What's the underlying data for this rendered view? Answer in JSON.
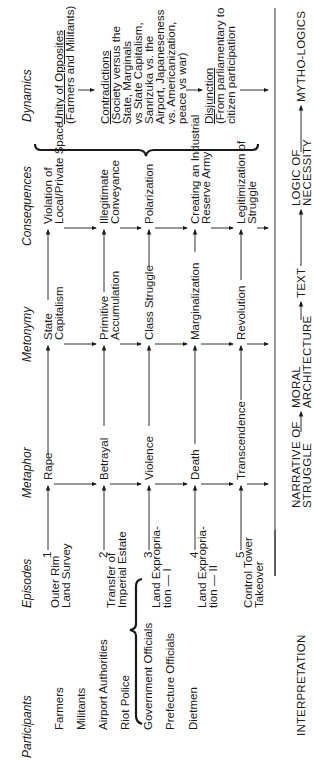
{
  "headers": {
    "participants": "Participants",
    "episodes": "Episodes",
    "metaphor": "Metaphor",
    "metonymy": "Metonymy",
    "consequences": "Consequences",
    "dynamics": "Dynamics"
  },
  "participants": [
    "Farmers",
    "Militants",
    "Airport Authorities",
    "Riot Police",
    "Government Officials",
    "Prefecture Officials",
    "Dietmen"
  ],
  "episodes": [
    {
      "num": "1",
      "l1": "Outer Rim",
      "l2": "Land Survey"
    },
    {
      "num": "2",
      "l1": "Transfer of",
      "l2": "Imperial Estate"
    },
    {
      "num": "3",
      "l1": "Land Expropria-",
      "l2": "tion — I"
    },
    {
      "num": "4",
      "l1": "Land Expropria-",
      "l2": "tion — II"
    },
    {
      "num": "5",
      "l1": "Control Tower",
      "l2": "Takeover"
    }
  ],
  "metaphor": [
    "Rape",
    "Betrayal",
    "Violence",
    "Death",
    "Transcendence"
  ],
  "metonymy": [
    {
      "l1": "State",
      "l2": "Capitalism"
    },
    {
      "l1": "Primitive",
      "l2": "Accumulation"
    },
    {
      "l1": "Class Struggle",
      "l2": ""
    },
    {
      "l1": "Marginalization",
      "l2": ""
    },
    {
      "l1": "Revolution",
      "l2": ""
    }
  ],
  "consequences": [
    {
      "l1": "Violation of",
      "l2": "Local/Private Space"
    },
    {
      "l1": "Illegitimate",
      "l2": "Conveyance"
    },
    {
      "l1": "Polarization",
      "l2": ""
    },
    {
      "l1": "Creating an Industrial",
      "l2": "Reserve Army"
    },
    {
      "l1": "Legitimization of",
      "l2": "Struggle"
    }
  ],
  "dynamics": {
    "unity_title": "Unity of Opposites",
    "unity_sub": "(Farmers and Militants)",
    "contradictions_title": "Contradictions",
    "contradictions_lines": [
      "(Society versus the",
      "State, Marginals",
      "vs State Capitalism,",
      "Sanrizuka vs. the",
      "Airport, Japaneseness",
      "vs. Americanization,",
      "peace vs war)"
    ],
    "disjunction_title": "Disjunction",
    "disjunction_lines": [
      "(From parliamentary to",
      "citizen participation"
    ]
  },
  "interpretation": {
    "label": "INTERPRETATION",
    "narrative_l1": "NARRATIVE OF",
    "narrative_l2": "STRUGGLE",
    "moral_l1": "MORAL",
    "moral_l2": "ARCHITECTURE",
    "text": "TEXT",
    "logic_l1": "LOGIC OF",
    "logic_l2": "NECESSITY",
    "mytho": "MYTHO-LOGICS"
  }
}
